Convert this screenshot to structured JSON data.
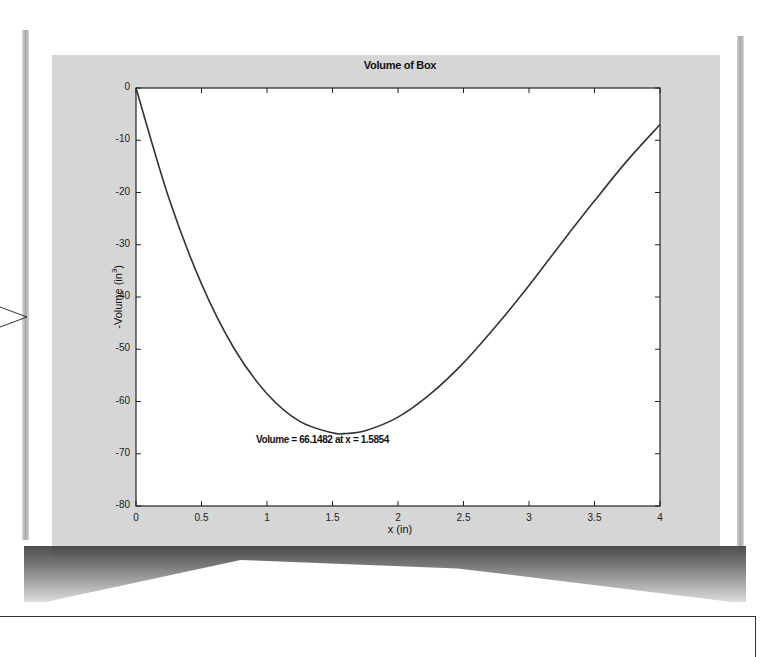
{
  "chart_data": {
    "type": "line",
    "title": "Volume of Box",
    "xlabel": "x (in)",
    "ylabel": "-Volume (in",
    "ylabel_superscript": "3",
    "ylabel_close": ")",
    "xlim": [
      0,
      4
    ],
    "ylim": [
      -80,
      0
    ],
    "grid": false,
    "legend": null,
    "x_ticks": [
      "0",
      "0.5",
      "1",
      "1.5",
      "2",
      "2.5",
      "3",
      "3.5",
      "4"
    ],
    "y_ticks": [
      "0",
      "-10",
      "-20",
      "-30",
      "-40",
      "-50",
      "-60",
      "-70",
      "-80"
    ],
    "annotation": "Volume = 66.1482 at x = 1.5854",
    "series": [
      {
        "name": "-Volume",
        "x": [
          0,
          0.25,
          0.5,
          0.75,
          1.0,
          1.25,
          1.5,
          1.5854,
          1.75,
          2.0,
          2.25,
          2.5,
          2.75,
          3.0,
          3.25,
          3.5,
          3.75,
          4.0
        ],
        "values": [
          0,
          -21.0,
          -37.5,
          -49.9,
          -58.5,
          -63.8,
          -66.0,
          -66.1482,
          -65.6,
          -63.0,
          -58.5,
          -52.6,
          -45.5,
          -37.8,
          -29.6,
          -21.6,
          -13.9,
          -7.0
        ]
      }
    ],
    "minimum": {
      "x": 1.5854,
      "value": -66.1482
    }
  },
  "colors": {
    "panel": "#d6d6d6",
    "plot_bg": "#ffffff",
    "line": "#333333"
  }
}
